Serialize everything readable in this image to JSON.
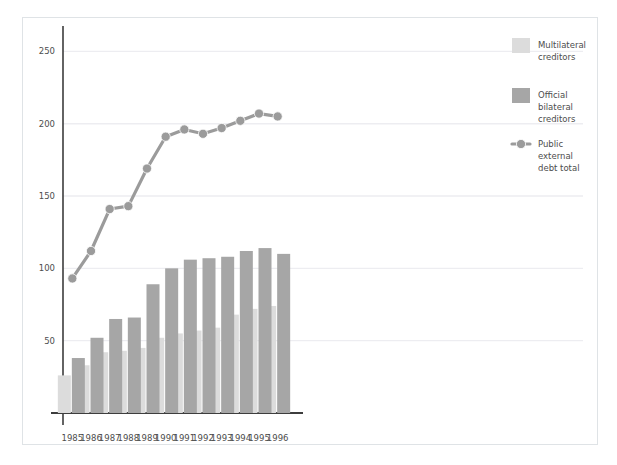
{
  "chart_data": {
    "type": "bar",
    "title": "",
    "subtitle": "",
    "xlabel": "",
    "ylabel": "",
    "categories": [
      "1985",
      "1986",
      "1987",
      "1988",
      "1989",
      "1990",
      "1991",
      "1992",
      "1993",
      "1994",
      "1995",
      "1996"
    ],
    "ylim": [
      0,
      262
    ],
    "yticks": [
      50,
      100,
      150,
      200,
      250
    ],
    "ytick_labels": [
      "50",
      "100",
      "150",
      "200",
      "250"
    ],
    "grid": true,
    "legend_position": "right",
    "series": [
      {
        "name": "Multilateral creditors",
        "type": "bar",
        "color": "#dcdcdc",
        "values": [
          26,
          33,
          42,
          43,
          45,
          52,
          55,
          57,
          59,
          68,
          72,
          74
        ]
      },
      {
        "name": "Official bilateral creditors",
        "type": "bar",
        "color": "#a6a6a6",
        "values": [
          38,
          52,
          65,
          66,
          89,
          100,
          106,
          107,
          108,
          112,
          114,
          110
        ]
      },
      {
        "name": "Public external debt total",
        "type": "line",
        "color": "#9b9b9b",
        "values": [
          93,
          112,
          141,
          143,
          169,
          191,
          196,
          193,
          197,
          202,
          207,
          205
        ]
      }
    ]
  },
  "legend": {
    "items": [
      {
        "label_lines": [
          "Multilateral",
          "creditors"
        ],
        "marker": "swatch",
        "color": "#dcdcdc"
      },
      {
        "label_lines": [
          "Official",
          "bilateral",
          "creditors"
        ],
        "marker": "swatch",
        "color": "#a6a6a6"
      },
      {
        "label_lines": [
          "Public",
          "external",
          "debt total"
        ],
        "marker": "line-dot",
        "color": "#9b9b9b"
      }
    ]
  },
  "colors": {
    "frame_border": "#dfe3e6",
    "axis": "#3d3d3d",
    "gridline": "#ededf1",
    "text": "#4d4d4d",
    "background": "#ffffff"
  }
}
